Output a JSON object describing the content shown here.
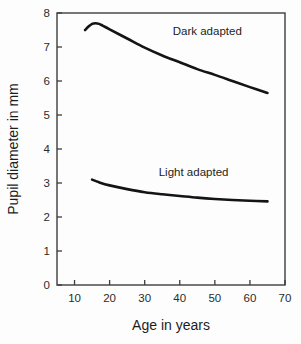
{
  "chart_data": {
    "type": "line",
    "title": "",
    "xlabel": "Age in years",
    "ylabel": "Pupil diameter in mm",
    "xlim": [
      5,
      70
    ],
    "ylim": [
      0,
      8
    ],
    "xticks": [
      10,
      20,
      30,
      40,
      50,
      60,
      70
    ],
    "yticks": [
      0,
      1,
      2,
      3,
      4,
      5,
      6,
      7,
      8
    ],
    "xtick_labels": [
      "10",
      "20",
      "30",
      "40",
      "50",
      "60",
      "70"
    ],
    "ytick_labels": [
      "0",
      "1",
      "2",
      "3",
      "4",
      "5",
      "6",
      "7",
      "8"
    ],
    "grid": false,
    "legend_position": "inline-annotation",
    "line_color": "#141414",
    "series": [
      {
        "name": "Dark adapted",
        "label_x": 38,
        "label_y": 7.35,
        "x": [
          13,
          14,
          15,
          16,
          17,
          18,
          20,
          25,
          30,
          35,
          40,
          45,
          50,
          55,
          60,
          65
        ],
        "values": [
          7.5,
          7.6,
          7.68,
          7.7,
          7.68,
          7.63,
          7.52,
          7.25,
          6.98,
          6.75,
          6.55,
          6.35,
          6.18,
          6.0,
          5.82,
          5.65
        ]
      },
      {
        "name": "Light adapted",
        "label_x": 34,
        "label_y": 3.2,
        "x": [
          15,
          17,
          20,
          25,
          30,
          35,
          40,
          45,
          50,
          55,
          60,
          65
        ],
        "values": [
          3.1,
          3.02,
          2.93,
          2.82,
          2.73,
          2.67,
          2.62,
          2.57,
          2.53,
          2.5,
          2.48,
          2.46
        ]
      }
    ]
  },
  "figure": {
    "x_axis_title": "Age in years",
    "y_axis_title": "Pupil diameter in mm"
  }
}
